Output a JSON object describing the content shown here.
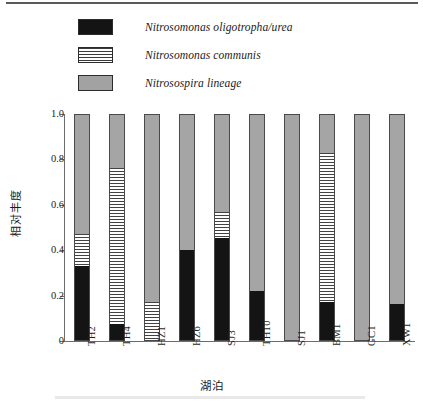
{
  "figure": {
    "legend": {
      "items": [
        {
          "label": "Nitrosomonas oligotropha/urea",
          "swatch": "solid-black-swatch",
          "color": "#141414"
        },
        {
          "label": "Nitrosomonas communis",
          "swatch": "horizontal-lined-swatch",
          "color": "#ffffff"
        },
        {
          "label": "Nitrosospira lineage",
          "swatch": "solid-gray-swatch",
          "color": "#a5a5a5"
        }
      ]
    }
  },
  "chart_data": {
    "type": "bar",
    "subtype": "stacked-bar",
    "title": "",
    "xlabel": "湖泊",
    "ylabel": "相对丰度",
    "ylim": [
      0,
      1.0
    ],
    "ytick_labels": [
      "0",
      "0.2",
      "0.4",
      "0.6",
      "0.8",
      "1.0"
    ],
    "ytick_values": [
      0,
      0.2,
      0.4,
      0.6,
      0.8,
      1.0
    ],
    "grid": false,
    "legend_position": "top-left",
    "categories": [
      "TH2",
      "TH4",
      "HZ1",
      "HZ6",
      "SJ3",
      "TH10",
      "SJ1",
      "BM1",
      "GC1",
      "XW1"
    ],
    "series": [
      {
        "name": "Nitrosomonas oligotropha/urea",
        "color": "#141414",
        "fill": "solid-black",
        "values": [
          0.33,
          0.07,
          0.0,
          0.4,
          0.455,
          0.22,
          0.0,
          0.17,
          0.0,
          0.16
        ]
      },
      {
        "name": "Nitrosomonas communis",
        "color": "#ffffff",
        "fill": "horizontal-lines",
        "values": [
          0.14,
          0.695,
          0.17,
          0.0,
          0.115,
          0.0,
          0.0,
          0.66,
          0.0,
          0.0
        ]
      },
      {
        "name": "Nitrosospira lineage",
        "color": "#a5a5a5",
        "fill": "solid-gray",
        "values": [
          0.53,
          0.235,
          0.83,
          0.6,
          0.43,
          0.78,
          1.0,
          0.17,
          1.0,
          0.84
        ]
      }
    ]
  }
}
